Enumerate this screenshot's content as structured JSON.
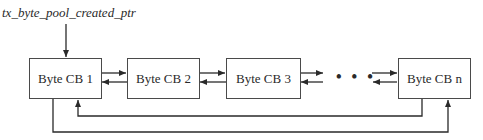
{
  "diagram": {
    "head_pointer_label": "tx_byte_pool_created_ptr",
    "nodes": [
      {
        "id": "cb1",
        "label": "Byte CB 1"
      },
      {
        "id": "cb2",
        "label": "Byte CB 2"
      },
      {
        "id": "cb3",
        "label": "Byte CB 3"
      },
      {
        "id": "cbn",
        "label": "Byte CB n"
      }
    ],
    "ellipsis": "• • •",
    "edges": [
      {
        "from": "head_pointer",
        "to": "cb1",
        "type": "pointer"
      },
      {
        "from": "cb1",
        "to": "cb2",
        "type": "next"
      },
      {
        "from": "cb2",
        "to": "cb1",
        "type": "previous"
      },
      {
        "from": "cb2",
        "to": "cb3",
        "type": "next"
      },
      {
        "from": "cb3",
        "to": "cb2",
        "type": "previous"
      },
      {
        "from": "cb3",
        "to": "ellipsis",
        "type": "next"
      },
      {
        "from": "ellipsis",
        "to": "cb3",
        "type": "previous"
      },
      {
        "from": "ellipsis",
        "to": "cbn",
        "type": "next"
      },
      {
        "from": "cbn",
        "to": "ellipsis",
        "type": "previous"
      },
      {
        "from": "cbn",
        "to": "cb1",
        "type": "next-wraparound"
      },
      {
        "from": "cb1",
        "to": "cbn",
        "type": "previous-wraparound"
      }
    ],
    "colors": {
      "line": "#2a2a2a",
      "box_border": "#4a4a4a",
      "background": "#ffffff"
    }
  }
}
